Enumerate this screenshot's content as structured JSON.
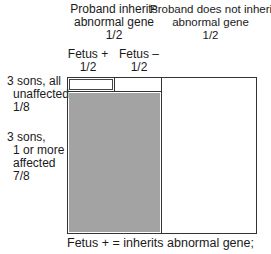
{
  "columns": {
    "inherits": {
      "line1": "Proband inherits",
      "line2": "abnormal gene",
      "prob": "1/2"
    },
    "not_inherit": {
      "line1": "Proband does not inherit",
      "line2": "abnormal gene",
      "prob": "1/2"
    },
    "fetus_pos": {
      "label": "Fetus +",
      "prob": "1/2"
    },
    "fetus_neg": {
      "label": "Fetus –",
      "prob": "1/2"
    }
  },
  "rows": {
    "unaffected": {
      "line1": "3 sons, all",
      "line2": "unaffected",
      "prob": "1/8"
    },
    "affected": {
      "line1": "3 sons,",
      "line2": "1 or more",
      "line3": "affected",
      "prob": "7/8"
    }
  },
  "caption": "Fetus + = inherits abnormal gene;",
  "colors": {
    "shaded_region": "#a3a3a3",
    "lines": "#333333"
  }
}
